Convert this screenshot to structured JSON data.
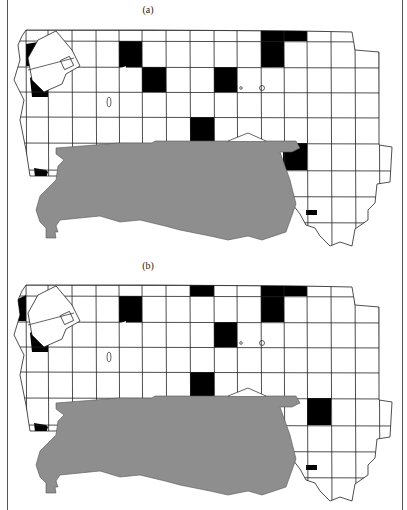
{
  "figure": {
    "panels": [
      {
        "label": "(a)",
        "label_pos": {
          "x": 128,
          "y": 2
        },
        "offset_y": 0,
        "black_cells": [
          {
            "x": 119,
            "y": 41,
            "w": 23,
            "h": 26
          },
          {
            "x": 142,
            "y": 67,
            "w": 24,
            "h": 25
          },
          {
            "x": 214,
            "y": 67,
            "w": 23,
            "h": 25
          },
          {
            "x": 261,
            "y": 30,
            "w": 46,
            "h": 11
          },
          {
            "x": 261,
            "y": 41,
            "w": 23,
            "h": 26
          },
          {
            "x": 190,
            "y": 117,
            "w": 24,
            "h": 26
          },
          {
            "x": 283,
            "y": 143,
            "w": 24,
            "h": 27
          },
          {
            "x": 306,
            "y": 210,
            "w": 11,
            "h": 5
          }
        ],
        "black_polys": [
          "26,44 38,42 33,60 30,66 26,66",
          "30,78 36,73 44,86 48,84 48,97 32,97",
          "34,168 46,170 48,172 40,196 36,186"
        ]
      },
      {
        "label": "(b)",
        "label_pos": {
          "x": 128,
          "y": 258
        },
        "offset_y": 255,
        "black_cells": [
          {
            "x": 119,
            "y": 41,
            "w": 23,
            "h": 26
          },
          {
            "x": 190,
            "y": 30,
            "w": 24,
            "h": 11
          },
          {
            "x": 214,
            "y": 67,
            "w": 23,
            "h": 25
          },
          {
            "x": 261,
            "y": 30,
            "w": 46,
            "h": 11
          },
          {
            "x": 261,
            "y": 41,
            "w": 23,
            "h": 26
          },
          {
            "x": 190,
            "y": 117,
            "w": 24,
            "h": 26
          },
          {
            "x": 307,
            "y": 143,
            "w": 24,
            "h": 27
          },
          {
            "x": 306,
            "y": 210,
            "w": 11,
            "h": 5
          }
        ],
        "black_polys": [
          "18,44 26,40 26,66 18,66 15,58 18,52",
          "30,78 36,73 44,86 48,84 48,97 32,97",
          "34,168 46,170 48,172 40,196 36,186"
        ]
      }
    ],
    "grid": {
      "cols": [
        26,
        48,
        72,
        96,
        119,
        142,
        166,
        190,
        214,
        237,
        261,
        284,
        307,
        331,
        355,
        379
      ],
      "rows": [
        30,
        41,
        67,
        92,
        117,
        143,
        170,
        196,
        222
      ],
      "outline": "26,30 150,30 300,31 352,32 355,50 379,52 379,145 392,147 390,182 377,184 375,203 368,210 368,220 355,229 352,246 340,242 330,246 320,236 315,228 306,225 300,214 293,205 283,196 276,190 270,176 30,176 26,150 20,120 24,100 14,80 20,60 18,45 22,36"
    },
    "lake": {
      "outline": "56,148 95,145 118,143 152,143 155,141 296,141 300,148 292,152 280,152 290,180 296,204 286,232 262,240 248,236 228,240 210,236 190,232 180,230 165,226 140,220 120,222 100,216 80,218 60,220 56,226 58,232 55,232 56,238 46,238 46,228 40,222 36,210 40,196 50,186 56,180 58,166 64,160 56,154"
    },
    "colors": {
      "cell_fill": "#000000",
      "lake_fill": "#8e8e8e",
      "grid_stroke": "#222222",
      "background": "#ffffff"
    }
  }
}
